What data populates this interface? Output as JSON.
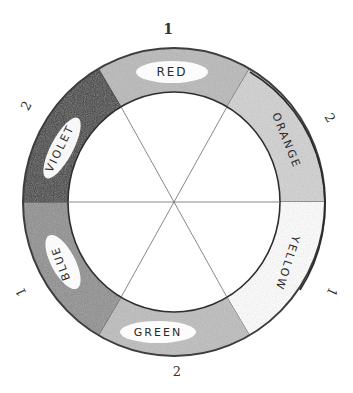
{
  "diagram": {
    "type": "color-wheel",
    "style": "hand-drawn pencil",
    "center": [
      174,
      202
    ],
    "outer_radius": [
      151,
      154
    ],
    "inner_radius": [
      106,
      110
    ],
    "segments": [
      {
        "name": "red",
        "label": "RED",
        "start_deg": 60,
        "end_deg": 120,
        "fill": "#b9b9b9",
        "order": "1"
      },
      {
        "name": "orange",
        "label": "ORANGE",
        "start_deg": 0,
        "end_deg": 60,
        "fill": "#d2d2d2",
        "order": "2"
      },
      {
        "name": "yellow",
        "label": "YELLOW",
        "start_deg": -60,
        "end_deg": 0,
        "fill": "#ffffff",
        "order": "1"
      },
      {
        "name": "green",
        "label": "GREEN",
        "start_deg": 240,
        "end_deg": 300,
        "fill": "#bdbdbd",
        "order": "2"
      },
      {
        "name": "blue",
        "label": "BLUE",
        "start_deg": 180,
        "end_deg": 240,
        "fill": "#8e8e8e",
        "order": "1"
      },
      {
        "name": "violet",
        "label": "VIOLET",
        "start_deg": 120,
        "end_deg": 180,
        "fill": "#3a3a3a",
        "order": "2"
      }
    ],
    "numbers": [
      {
        "text": "1",
        "position": "top"
      },
      {
        "text": "2",
        "position": "upper-right"
      },
      {
        "text": "1",
        "position": "lower-right"
      },
      {
        "text": "2",
        "position": "bottom"
      },
      {
        "text": "1",
        "position": "lower-left"
      },
      {
        "text": "2",
        "position": "upper-left"
      }
    ],
    "line_color": "#555555",
    "border_color": "#3d3d3d"
  }
}
